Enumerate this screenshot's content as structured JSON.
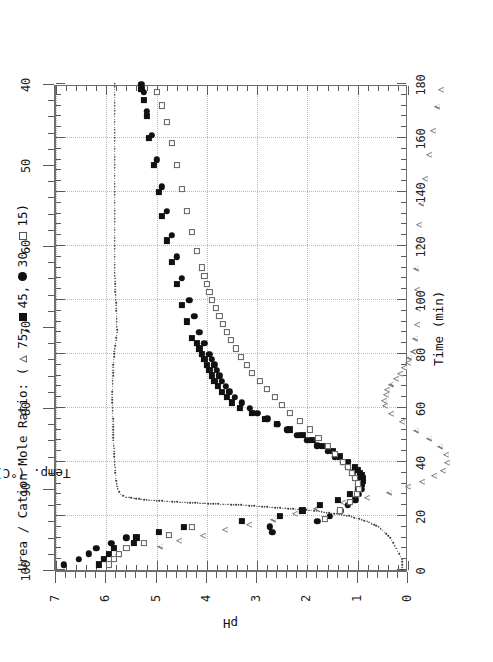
{
  "figure": {
    "legend_prefix": "Urea / Cation Mole Ratio: (",
    "legend_suffix": ")",
    "legend_items": [
      {
        "marker": "open-triangle",
        "label": "75,"
      },
      {
        "marker": "filled-square",
        "label": "45,"
      },
      {
        "marker": "filled-circle",
        "label": "30,"
      },
      {
        "marker": "open-square",
        "label": "15"
      }
    ],
    "temp_annotation": "Temp. (°C)"
  },
  "chart_data": {
    "type": "scatter",
    "title": "",
    "xlabel": "Time (min)",
    "ylabel": "pH",
    "y2label": "Temp. (°C)",
    "xlim": [
      0,
      180
    ],
    "ylim": [
      0,
      7
    ],
    "y2lim": [
      40,
      100
    ],
    "xticks": [
      0,
      20,
      40,
      60,
      80,
      100,
      120,
      140,
      160,
      180
    ],
    "yticks": [
      0,
      1,
      2,
      3,
      4,
      5,
      6,
      7
    ],
    "y2ticks": [
      40,
      50,
      60,
      70,
      80,
      90,
      100
    ],
    "grid": true,
    "legend_position": "above-plot",
    "legend_title": "Urea / Cation Mole Ratio",
    "series": [
      {
        "name": "75",
        "marker": "open-triangle",
        "x": [
          4,
          6,
          9,
          11,
          13,
          15,
          17,
          19,
          21,
          23,
          25,
          27,
          29,
          31,
          33,
          35,
          37,
          40,
          43,
          46,
          49,
          52,
          55,
          58,
          61,
          63,
          65,
          67,
          69,
          71,
          73,
          75,
          77,
          79,
          81,
          86,
          91,
          97,
          104,
          112,
          120,
          128,
          136,
          145,
          154,
          163,
          172,
          178
        ],
        "y": [
          6.05,
          5.9,
          5.2,
          4.95,
          4.6,
          4.3,
          3.95,
          3.6,
          3.3,
          3.0,
          2.6,
          2.25,
          1.95,
          1.7,
          1.55,
          1.45,
          1.4,
          1.45,
          1.6,
          1.85,
          2.2,
          2.6,
          3.0,
          3.35,
          3.6,
          3.75,
          3.85,
          3.95,
          4.0,
          4.05,
          4.1,
          4.15,
          4.2,
          4.3,
          4.35,
          4.45,
          4.55,
          4.65,
          4.8,
          4.95,
          5.05,
          5.15,
          5.25,
          5.3,
          5.35,
          5.4,
          5.45,
          5.5
        ]
      },
      {
        "name": "45",
        "marker": "filled-square",
        "x": [
          2,
          4,
          6,
          8,
          10,
          12,
          14,
          16,
          18,
          20,
          22,
          24,
          26,
          28,
          30,
          31,
          32,
          33,
          34,
          35,
          36,
          37,
          38,
          40,
          42,
          44,
          46,
          48,
          50,
          52,
          54,
          56,
          58,
          60,
          62,
          64,
          66,
          68,
          70,
          72,
          74,
          76,
          78,
          80,
          82,
          84,
          86,
          92,
          98,
          106,
          114,
          122,
          131,
          140,
          150,
          160,
          168,
          174,
          178
        ],
        "y": [
          6.15,
          6.05,
          5.95,
          5.85,
          5.45,
          5.4,
          4.95,
          4.45,
          3.3,
          2.55,
          2.1,
          1.75,
          1.4,
          1.15,
          1.0,
          0.95,
          0.92,
          0.9,
          0.9,
          0.92,
          0.95,
          1.0,
          1.05,
          1.2,
          1.35,
          1.5,
          1.7,
          1.9,
          2.1,
          2.35,
          2.6,
          2.85,
          3.1,
          3.35,
          3.5,
          3.6,
          3.7,
          3.78,
          3.85,
          3.9,
          3.95,
          4.0,
          4.05,
          4.1,
          4.15,
          4.2,
          4.3,
          4.4,
          4.5,
          4.6,
          4.7,
          4.8,
          4.9,
          4.95,
          5.05,
          5.15,
          5.2,
          5.25,
          5.3
        ]
      },
      {
        "name": "30",
        "marker": "filled-circle",
        "x": [
          2,
          4,
          6,
          8,
          10,
          12,
          14,
          16,
          18,
          20,
          22,
          24,
          26,
          28,
          30,
          32,
          34,
          36,
          38,
          40,
          42,
          44,
          46,
          48,
          50,
          52,
          54,
          56,
          58,
          60,
          62,
          64,
          66,
          68,
          70,
          72,
          74,
          76,
          78,
          80,
          84,
          88,
          94,
          100,
          108,
          116,
          124,
          133,
          142,
          152,
          161,
          170,
          177,
          180
        ],
        "y": [
          6.85,
          6.55,
          6.35,
          6.2,
          5.9,
          5.6,
          2.7,
          2.75,
          1.8,
          1.55,
          1.35,
          1.2,
          1.05,
          0.98,
          0.93,
          0.95,
          1.0,
          1.1,
          1.2,
          1.3,
          1.45,
          1.6,
          1.8,
          2.0,
          2.2,
          2.4,
          2.6,
          2.8,
          3.0,
          3.15,
          3.3,
          3.45,
          3.55,
          3.62,
          3.7,
          3.75,
          3.8,
          3.85,
          3.9,
          3.95,
          4.05,
          4.15,
          4.25,
          4.35,
          4.5,
          4.6,
          4.7,
          4.8,
          4.9,
          5.0,
          5.1,
          5.2,
          5.25,
          5.3
        ]
      },
      {
        "name": "15",
        "marker": "open-square",
        "x": [
          2,
          4,
          6,
          8,
          10,
          13,
          16,
          19,
          22,
          25,
          28,
          30,
          32,
          34,
          36,
          38,
          40,
          43,
          46,
          49,
          52,
          55,
          58,
          61,
          64,
          67,
          70,
          73,
          76,
          79,
          82,
          85,
          88,
          91,
          94,
          97,
          100,
          103,
          106,
          109,
          112,
          118,
          125,
          133,
          141,
          150,
          158,
          166,
          172,
          177
        ],
        "y": [
          5.95,
          5.85,
          5.75,
          5.6,
          5.25,
          4.75,
          4.3,
          1.65,
          1.35,
          1.15,
          1.02,
          0.98,
          1.0,
          1.05,
          1.12,
          1.2,
          1.3,
          1.45,
          1.6,
          1.78,
          1.95,
          2.15,
          2.35,
          2.5,
          2.65,
          2.8,
          2.95,
          3.1,
          3.2,
          3.32,
          3.42,
          3.52,
          3.6,
          3.68,
          3.75,
          3.82,
          3.9,
          3.95,
          4.0,
          4.05,
          4.1,
          4.2,
          4.3,
          4.4,
          4.5,
          4.6,
          4.7,
          4.8,
          4.9,
          5.0
        ]
      }
    ],
    "temperature_curve": {
      "name": "Temp. (°C)",
      "style": "dotted-line",
      "axis": "y2",
      "x": [
        0,
        2,
        4,
        6,
        8,
        10,
        12,
        14,
        16,
        18,
        20,
        22,
        24,
        25,
        26,
        27,
        28,
        30,
        34,
        40,
        48,
        56,
        64,
        72,
        80,
        88,
        96,
        104,
        112,
        120,
        130,
        140,
        150,
        160,
        170,
        180
      ],
      "y": [
        41,
        41,
        41,
        41.5,
        42,
        42.5,
        43,
        44,
        45,
        47,
        50,
        56,
        68,
        78,
        85,
        88,
        89,
        89.5,
        89.8,
        90,
        90.2,
        90.3,
        90.4,
        90.3,
        90.1,
        89.6,
        89.7,
        89.9,
        90,
        90,
        90,
        90,
        90,
        90,
        90,
        90
      ]
    }
  }
}
